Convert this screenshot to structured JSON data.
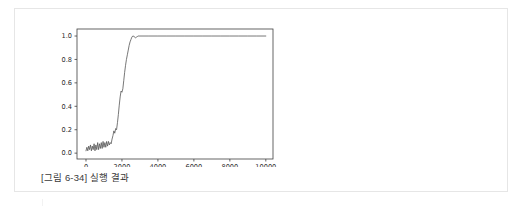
{
  "figure": {
    "caption": "[그림 6-34] 실행 결과",
    "border_color": "#e6e6e6",
    "background": "#ffffff"
  },
  "chart_data": {
    "type": "line",
    "title": "",
    "xlabel": "",
    "ylabel": "",
    "xlim": [
      -500,
      10400
    ],
    "ylim": [
      -0.05,
      1.06
    ],
    "grid": false,
    "legend": null,
    "line_color": "#555555",
    "line_width": 0.8,
    "axis_color": "#3f3f3f",
    "xticks": [
      0,
      2000,
      4000,
      6000,
      8000,
      10000
    ],
    "xtick_labels": [
      "0",
      "2000",
      "4000",
      "6000",
      "8000",
      "10000"
    ],
    "yticks": [
      0.0,
      0.2,
      0.4,
      0.6,
      0.8,
      1.0
    ],
    "ytick_labels": [
      "0.0",
      "0.2",
      "0.4",
      "0.6",
      "0.8",
      "1.0"
    ],
    "series": [
      {
        "name": "accuracy",
        "x": [
          0,
          50,
          100,
          150,
          200,
          250,
          300,
          350,
          400,
          450,
          500,
          550,
          600,
          650,
          700,
          750,
          800,
          850,
          900,
          950,
          1000,
          1050,
          1100,
          1150,
          1200,
          1250,
          1300,
          1350,
          1400,
          1450,
          1500,
          1550,
          1600,
          1650,
          1700,
          1750,
          1800,
          1850,
          1900,
          1950,
          2000,
          2050,
          2100,
          2150,
          2200,
          2250,
          2300,
          2350,
          2400,
          2450,
          2500,
          2550,
          2600,
          2650,
          2700,
          2750,
          2800,
          2850,
          2900,
          2950,
          3000,
          3500,
          4000,
          4500,
          5000,
          5500,
          6000,
          6500,
          7000,
          7500,
          8000,
          8500,
          9000,
          9500,
          10000
        ],
        "y": [
          0.02,
          0.05,
          0.02,
          0.06,
          0.03,
          0.07,
          0.02,
          0.06,
          0.03,
          0.08,
          0.02,
          0.07,
          0.03,
          0.09,
          0.03,
          0.08,
          0.04,
          0.09,
          0.04,
          0.1,
          0.05,
          0.09,
          0.05,
          0.1,
          0.06,
          0.1,
          0.07,
          0.09,
          0.08,
          0.12,
          0.15,
          0.19,
          0.17,
          0.21,
          0.2,
          0.26,
          0.33,
          0.41,
          0.48,
          0.53,
          0.52,
          0.55,
          0.62,
          0.69,
          0.75,
          0.8,
          0.84,
          0.88,
          0.92,
          0.95,
          0.97,
          0.99,
          1.0,
          1.0,
          0.99,
          0.985,
          0.99,
          0.995,
          1.0,
          1.0,
          1.0,
          1.0,
          1.0,
          1.0,
          1.0,
          1.0,
          1.0,
          1.0,
          1.0,
          1.0,
          1.0,
          1.0,
          1.0,
          1.0,
          1.0
        ]
      }
    ]
  }
}
